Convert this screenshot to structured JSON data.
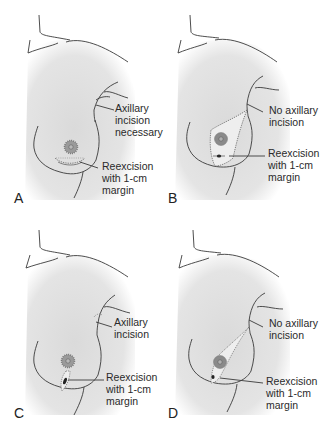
{
  "figure": {
    "colors": {
      "skin_shade": "#d9d9d9",
      "line": "#3a3a3a",
      "areola": "#8a8a8a",
      "areola_ring": "#9a9a9a",
      "nipple": "#777777",
      "excision_fill": "#eeeeee",
      "background": "#ffffff"
    },
    "panels": [
      {
        "letter": "A",
        "axillary_label": [
          "Axillary",
          "incision",
          "necessary"
        ],
        "reexcision_label": [
          "Reexcision",
          "with 1-cm",
          "margin"
        ],
        "incision_type": "inframammary arc below areola",
        "axillary_incision": true
      },
      {
        "letter": "B",
        "axillary_label": [
          "No axillary",
          "incision"
        ],
        "reexcision_label": [
          "Reexcision",
          "with 1-cm",
          "margin"
        ],
        "incision_type": "wide lateral wedge extending toward axilla",
        "axillary_incision": false
      },
      {
        "letter": "C",
        "axillary_label": [
          "Axillary",
          "incision"
        ],
        "reexcision_label": [
          "Reexcision",
          "with 1-cm",
          "margin"
        ],
        "incision_type": "radial ellipse below areola",
        "axillary_incision": true
      },
      {
        "letter": "D",
        "axillary_label": [
          "No axillary",
          "incision"
        ],
        "reexcision_label": [
          "Reexcision",
          "with 1-cm",
          "margin"
        ],
        "incision_type": "narrow radial wedge extending toward axilla",
        "axillary_incision": false
      }
    ]
  }
}
